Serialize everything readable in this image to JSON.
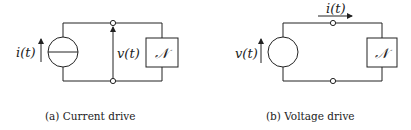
{
  "figures": [
    {
      "id": "a",
      "caption": "(a) Current drive",
      "source_label": "i(t)",
      "source_type": "current-source",
      "voltage_label": "v(t)",
      "load_label": "𝒩"
    },
    {
      "id": "b",
      "caption": "(b) Voltage drive",
      "source_label": "v(t)",
      "source_type": "voltage-source",
      "current_label": "i(t)",
      "load_label": "𝒩"
    }
  ]
}
